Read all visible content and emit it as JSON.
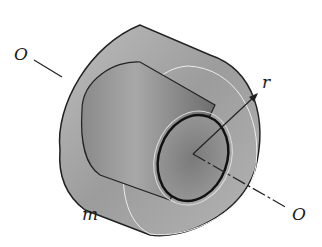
{
  "figure": {
    "labels": {
      "axis_left": "O",
      "axis_right": "O",
      "radius": "r",
      "mass": "m"
    },
    "colors": {
      "outer_body": "#9a9a9a",
      "inner_bore": "#7a7a7a",
      "outline": "#222222"
    }
  }
}
